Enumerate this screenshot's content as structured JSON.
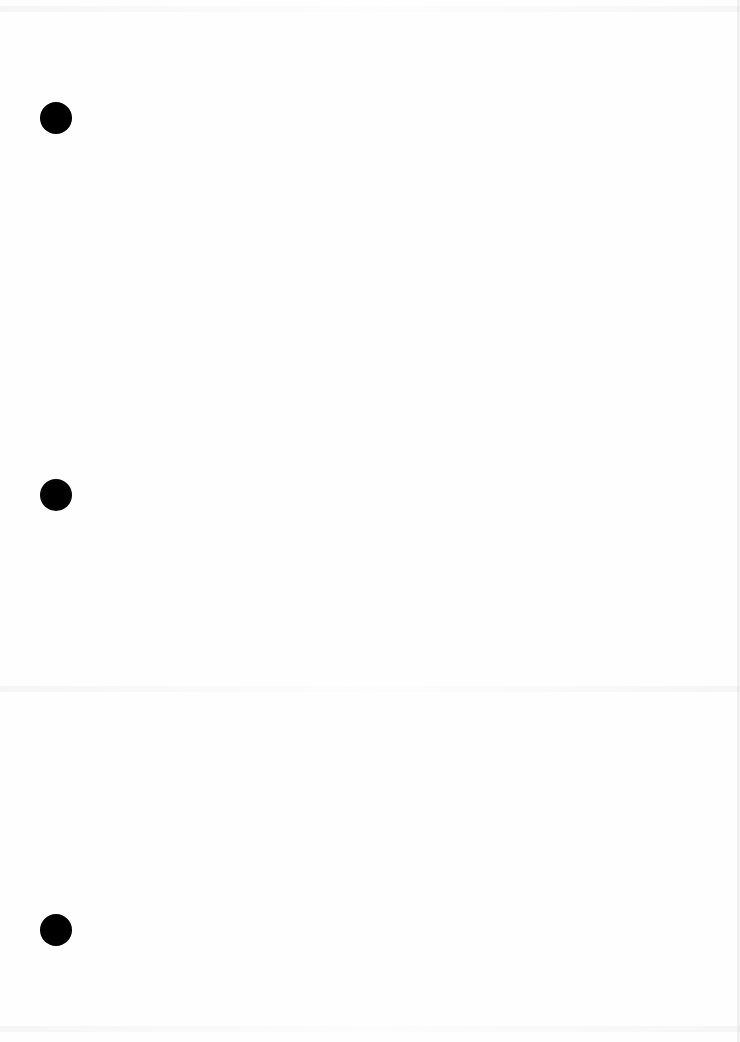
{
  "document": {
    "type": "blank scanned page",
    "text": "",
    "punch_holes": [
      {
        "label": "top-hole",
        "x": 40,
        "y": 102
      },
      {
        "label": "middle-hole",
        "x": 40,
        "y": 479
      },
      {
        "label": "bottom-hole",
        "x": 40,
        "y": 914
      }
    ],
    "colors": {
      "paper": "#fefefe",
      "hole": "#000000"
    }
  }
}
